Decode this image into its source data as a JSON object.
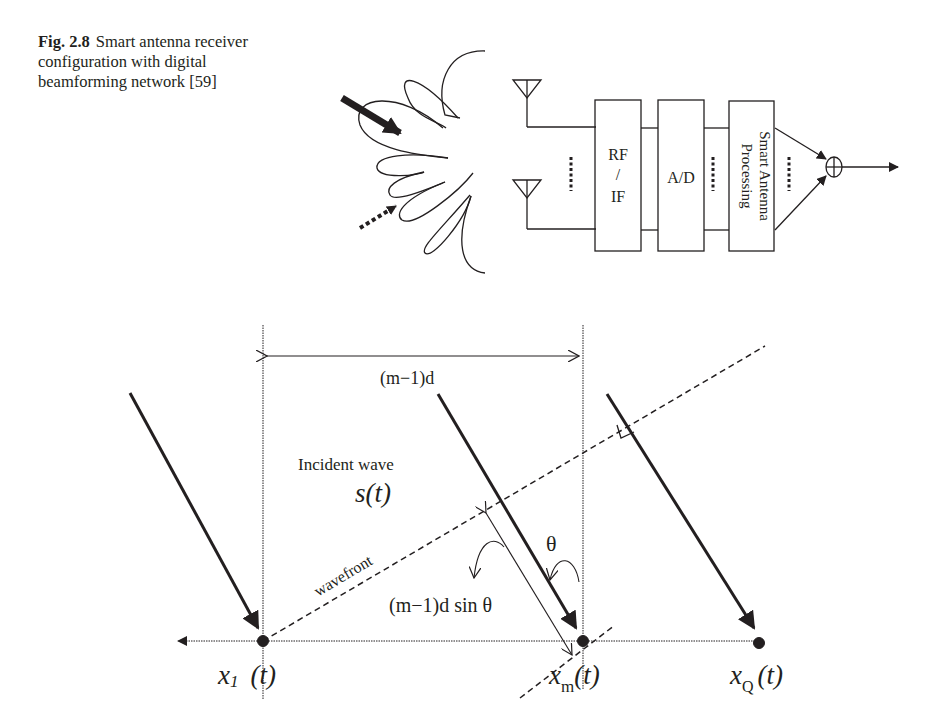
{
  "caption": {
    "label": "Fig. 2.8",
    "text": "Smart antenna receiver configuration with digital beamforming network [59]"
  },
  "top_diagram": {
    "blocks": [
      "RF",
      "/",
      "IF",
      "A/D",
      "Smart Antenna",
      "Processing"
    ],
    "combiner_symbol": "⊕"
  },
  "bottom_diagram": {
    "spacing_label": "(m−1)d",
    "incident_label": "Incident wave",
    "signal_label": "s(t)",
    "wavefront_label": "wavefront",
    "delay_label": "(m−1)d sin θ",
    "angle_label": "θ",
    "element_1": "x",
    "element_1_sub": "1",
    "element_m": "x",
    "element_m_sub": "m",
    "element_q": "x",
    "element_q_sub": "Q",
    "time_arg": "(t)"
  }
}
